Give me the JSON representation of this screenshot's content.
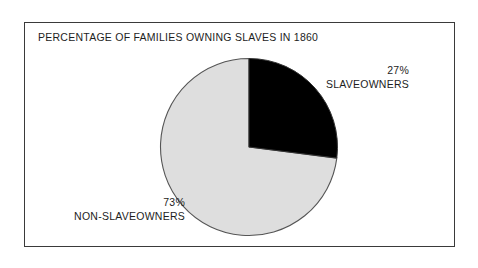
{
  "figure": {
    "title": "PERCENTAGE OF FAMILIES OWNING SLAVES IN 1860",
    "frame_color": "#3a3a3a",
    "background": "#ffffff"
  },
  "labels": {
    "slaveowners": {
      "percent": "27%",
      "name": "SLAVEOWNERS"
    },
    "non_slaveowners": {
      "percent": "73%",
      "name": "NON-SLAVEOWNERS"
    }
  },
  "chart_data": {
    "type": "pie",
    "title": "PERCENTAGE OF FAMILIES OWNING SLAVES IN 1860",
    "xlabel": "",
    "ylabel": "",
    "categories": [
      "SLAVEOWNERS",
      "NON-SLAVEOWNERS"
    ],
    "values": [
      27,
      73
    ],
    "units": "percent",
    "total": 100,
    "colors": [
      "#000000",
      "#dedede"
    ],
    "slice_edge_color": "#555555",
    "start_angle_deg": 90,
    "direction": "clockwise",
    "legend": "none",
    "grid": false,
    "data_labels": [
      "27% SLAVEOWNERS",
      "73% NON-SLAVEOWNERS"
    ],
    "label_positions": [
      "outside-right-top",
      "outside-left-bottom"
    ],
    "slices": [
      {
        "name": "SLAVEOWNERS",
        "value": 27,
        "color": "#000000",
        "sweep_deg": 97.2
      },
      {
        "name": "NON-SLAVEOWNERS",
        "value": 73,
        "color": "#dedede",
        "sweep_deg": 262.8
      }
    ]
  }
}
